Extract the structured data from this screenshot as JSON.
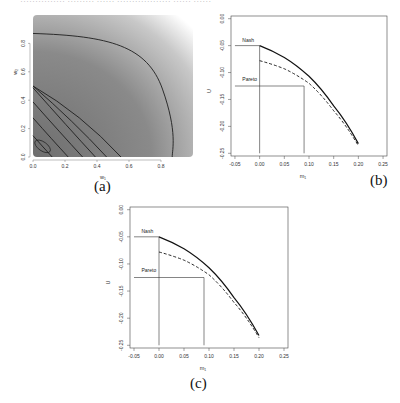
{
  "header": {
    "cut_text": "…………… ……… …… ……………… …… ……"
  },
  "captions": {
    "a": "(a)",
    "b": "(b)",
    "c": "(c)"
  },
  "chart_data": [
    {
      "id": "a",
      "type": "heatmap",
      "title": "",
      "xlabel": "w₁",
      "ylabel": "w₂",
      "xlim": [
        0,
        1
      ],
      "ylim": [
        0,
        1
      ],
      "xticks": [
        "0.0",
        "0.2",
        "0.4",
        "0.6",
        "0.8"
      ],
      "yticks": [
        "0.0",
        "0.2",
        "0.4",
        "0.6",
        "0.8"
      ],
      "grid": false,
      "colormap": "grayscale, dark near origin, light toward (1,1)",
      "contours": [
        {
          "kind": "ellipse",
          "center": [
            0.05,
            0.08
          ],
          "note": "innermost small ellipse"
        },
        {
          "kind": "arc",
          "x_intercept": 0.12
        },
        {
          "kind": "arc",
          "x_intercept": 0.22
        },
        {
          "kind": "arc",
          "x_intercept": 0.31
        },
        {
          "kind": "arc",
          "x_intercept": 0.39
        },
        {
          "kind": "arc",
          "x_intercept": 0.46
        },
        {
          "kind": "arc",
          "x_intercept": 0.55
        },
        {
          "kind": "arc",
          "x_intercept": 0.87,
          "y_intercept": 0.87
        }
      ]
    },
    {
      "id": "b",
      "type": "line",
      "xlabel": "m₁",
      "ylabel": "U",
      "xlim": [
        -0.05,
        0.25
      ],
      "ylim": [
        -0.25,
        0.0
      ],
      "xticks": [
        "-0.05",
        "0.00",
        "0.05",
        "0.10",
        "0.15",
        "0.20",
        "0.25"
      ],
      "yticks": [
        "0.00",
        "-0.05",
        "-0.10",
        "-0.15",
        "-0.20",
        "-0.25"
      ],
      "grid": false,
      "series": [
        {
          "name": "solid",
          "style": "solid",
          "x": [
            0.0,
            0.05,
            0.1,
            0.15,
            0.2
          ],
          "y": [
            -0.05,
            -0.072,
            -0.107,
            -0.162,
            -0.232
          ]
        },
        {
          "name": "dashed",
          "style": "dashed",
          "x": [
            0.0,
            0.05,
            0.1,
            0.15,
            0.2
          ],
          "y": [
            -0.078,
            -0.093,
            -0.12,
            -0.171,
            -0.236
          ]
        }
      ],
      "annotations": [
        {
          "text": "Nash",
          "x": -0.035,
          "y": -0.043,
          "hline_y": -0.05,
          "vline_x": 0.0
        },
        {
          "text": "Pareto",
          "x": -0.035,
          "y": -0.115,
          "hline_y": -0.125,
          "vline_x": 0.09
        }
      ]
    },
    {
      "id": "c",
      "type": "line",
      "xlabel": "m₁",
      "ylabel": "U",
      "xlim": [
        -0.05,
        0.25
      ],
      "ylim": [
        -0.25,
        0.0
      ],
      "xticks": [
        "-0.05",
        "0.00",
        "0.05",
        "0.10",
        "0.15",
        "0.20",
        "0.25"
      ],
      "yticks": [
        "0.00",
        "-0.05",
        "-0.10",
        "-0.15",
        "-0.20",
        "-0.25"
      ],
      "grid": false,
      "series": [
        {
          "name": "solid",
          "style": "solid",
          "x": [
            0.0,
            0.05,
            0.1,
            0.15,
            0.2
          ],
          "y": [
            -0.05,
            -0.072,
            -0.107,
            -0.162,
            -0.232
          ]
        },
        {
          "name": "dashed",
          "style": "dashed",
          "x": [
            0.0,
            0.05,
            0.1,
            0.15,
            0.2
          ],
          "y": [
            -0.078,
            -0.093,
            -0.12,
            -0.171,
            -0.236
          ]
        }
      ],
      "annotations": [
        {
          "text": "Nash",
          "x": -0.035,
          "y": -0.043,
          "hline_y": -0.05,
          "vline_x": 0.0
        },
        {
          "text": "Pareto",
          "x": -0.035,
          "y": -0.115,
          "hline_y": -0.125,
          "vline_x": 0.09
        }
      ]
    }
  ]
}
